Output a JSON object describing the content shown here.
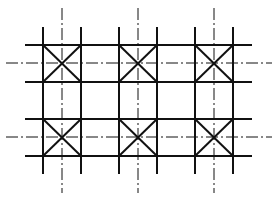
{
  "diagram": {
    "colors": {
      "line": "#111111",
      "background": "#ffffff"
    },
    "columns": [
      {
        "left": 43,
        "right": 81,
        "center": 62
      },
      {
        "left": 119,
        "right": 157,
        "center": 138
      },
      {
        "left": 195,
        "right": 233,
        "center": 214
      }
    ],
    "rows": [
      {
        "top": 45,
        "bottom": 82,
        "center": 63
      },
      {
        "top": 119,
        "bottom": 156,
        "center": 137
      }
    ],
    "extents": {
      "horizontal_line_x": [
        25,
        252
      ],
      "vertical_line_y": [
        27,
        174
      ],
      "centerline_h_x": [
        6,
        272
      ],
      "centerline_v_y": [
        8,
        193
      ]
    }
  }
}
